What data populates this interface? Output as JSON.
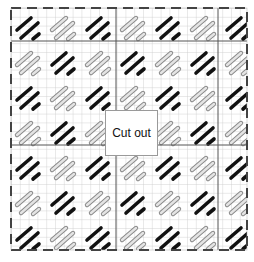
{
  "diagram": {
    "type": "knitting-chart",
    "cutout_label": "Cut out",
    "colors": {
      "background": "#ffffff",
      "grid_line": "#c8c8c8",
      "major_line": "#555555",
      "black_stroke": "#111111",
      "gray_stroke_fill": "#d9d9d9",
      "gray_stroke_outline": "#8a8a8a",
      "border_dash": "#111111",
      "cutout_border": "#9a9a9a"
    },
    "frame": {
      "x": 11,
      "y": 8,
      "width": 236,
      "height": 242
    },
    "cell_size": 8.8,
    "tile_size": 35
  }
}
